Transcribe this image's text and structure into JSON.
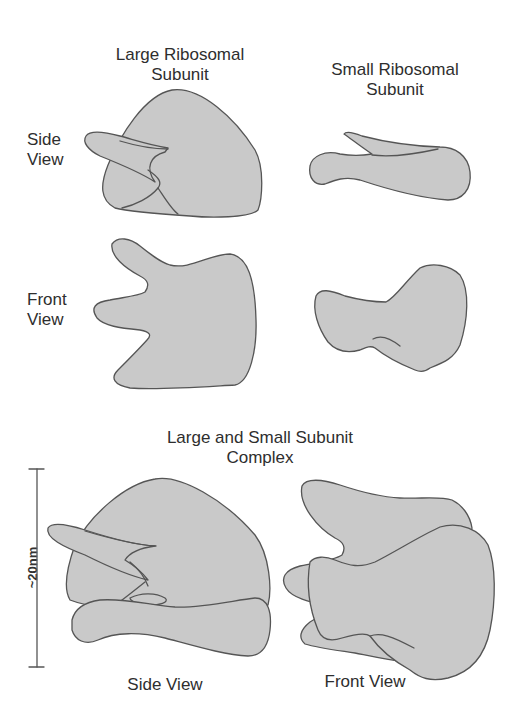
{
  "headings": {
    "large_subunit_line1": "Large Ribosomal",
    "large_subunit_line2": "Subunit",
    "small_subunit_line1": "Small Ribosomal",
    "small_subunit_line2": "Subunit",
    "complex_line1": "Large and Small Subunit",
    "complex_line2": "Complex"
  },
  "row_labels": {
    "side_line1": "Side",
    "side_line2": "View",
    "front_line1": "Front",
    "front_line2": "View"
  },
  "complex_labels": {
    "side_view": "Side View",
    "front_view": "Front View"
  },
  "scale_bar": {
    "label": "~20nm"
  },
  "colors": {
    "fill": "#c9c9c9",
    "outline": "#555555",
    "text": "#2e2e2e",
    "background": "#ffffff"
  }
}
